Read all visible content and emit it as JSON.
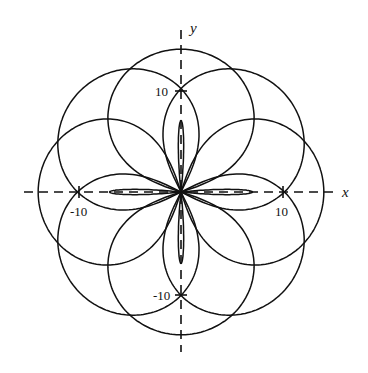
{
  "chart_data": {
    "type": "line",
    "subtype": "polar-rose",
    "title": "",
    "xlabel": "x",
    "ylabel": "y",
    "x_ticks": [
      {
        "value": -10,
        "label": "-10"
      },
      {
        "value": 10,
        "label": "10"
      }
    ],
    "y_ticks": [
      {
        "value": -10,
        "label": "-10"
      },
      {
        "value": 10,
        "label": "10"
      }
    ],
    "xlim": [
      -15,
      16
    ],
    "ylim": [
      -15,
      16
    ],
    "grid": false,
    "axes_style": "dashed",
    "curve": {
      "description": "Rose with 8 large lobes (r max about 14) and 4 small inner petals along the axes (r about 7)",
      "large_lobe_angles_deg": [
        0,
        45,
        90,
        135,
        180,
        225,
        270,
        315
      ],
      "large_lobe_max_r": 14,
      "small_petal_angles_deg": [
        0,
        90,
        180,
        270
      ],
      "small_petal_max_r": 7
    }
  },
  "labels": {
    "x_axis": "x",
    "y_axis": "y",
    "x_pos": "10",
    "x_neg": "-10",
    "y_pos": "10",
    "y_neg": "-10"
  },
  "colors": {
    "line": "#111111",
    "background": "#ffffff"
  }
}
